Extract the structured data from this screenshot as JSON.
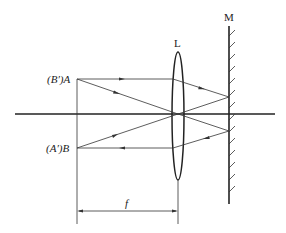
{
  "diagram": {
    "type": "optics-lens-mirror",
    "labels": {
      "lens": "L",
      "mirror": "M",
      "point_a": "(B′)A",
      "point_b": "(A′)B",
      "focal_length": "f"
    },
    "colors": {
      "stroke": "#222222",
      "background": "#ffffff"
    }
  }
}
